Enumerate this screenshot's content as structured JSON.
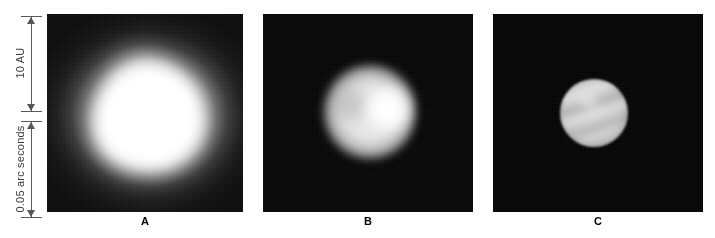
{
  "figure": {
    "background_color": "#ffffff",
    "width": 715,
    "height": 238
  },
  "axis": {
    "name": "vertical-scale-bars",
    "scale_bars": [
      {
        "id": "angular-distance-scale",
        "label": "10 AU",
        "top_px": 16,
        "bottom_px": 112,
        "line_color": "#58585a",
        "arrow_style": "double-headed"
      },
      {
        "id": "physical-distance-scale",
        "label": "0.05 arc seconds",
        "top_px": 121,
        "bottom_px": 218,
        "line_color": "#58585a",
        "arrow_style": "double-headed"
      }
    ]
  },
  "panels": [
    {
      "id": "panel-a",
      "caption": "A",
      "description": "large diffuse saturated white blob with broad halo on dark noisy background",
      "background_color": "#0b0b0b",
      "object_color": "#ffffff"
    },
    {
      "id": "panel-b",
      "caption": "B",
      "description": "medium round disk with brighter lobe right of centre on dark background",
      "background_color": "#050505",
      "object_color": "#eeeeee"
    },
    {
      "id": "panel-c",
      "caption": "C",
      "description": "small sharply resolved disk with diagonal bright bands on black background",
      "background_color": "#030303",
      "object_color": "#d2d2d2"
    }
  ]
}
